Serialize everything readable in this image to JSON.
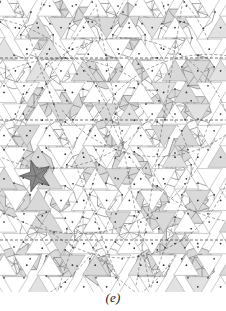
{
  "figure": {
    "caption": "(e)",
    "domain_note": "quasiperiodic pentagonal tiling diagram",
    "width": 226,
    "height": 311,
    "panel_height": 292,
    "background_color": "#ffffff"
  },
  "style": {
    "line_color": "#8d8d8d",
    "line_color_strong": "#6f6f6f",
    "dashed_line_color": "#3a3a3a",
    "vertex_color": "#2b2b2b",
    "fill_light": "#d9d9d9",
    "fill_light2": "#e2e2e2",
    "fill_mid": "#c9c9c9",
    "fill_dark": "#8a8a8a",
    "fill_white": "#fefefe",
    "stroke_width_thin": 0.45,
    "stroke_width_main": 0.6,
    "stroke_width_dash": 0.55,
    "vertex_radius": 0.85
  },
  "geometry": {
    "unit": 23.2,
    "cols": 11,
    "rows": 14,
    "row_step": 21.6,
    "col_step": 22.8,
    "rosette_radius": 17.5,
    "pentagon_radius": 12.2,
    "star_points": 5,
    "description": "decagonal rosettes on a near-periodic lattice, each subdivided into 5 or 10 triangular wedges"
  },
  "dashed_lines": {
    "orientation": "horizontal",
    "y_values": [
      58,
      120,
      240
    ],
    "dash_pattern": "3 2"
  },
  "rosettes": [
    {
      "cx": 14,
      "cy": 12,
      "r": 17.0,
      "type": "decagon",
      "fill": "white",
      "rot": 18
    },
    {
      "cx": 60,
      "cy": 10,
      "r": 17.0,
      "type": "decagon",
      "fill": "white",
      "rot": 0
    },
    {
      "cx": 106,
      "cy": 12,
      "r": 17.0,
      "type": "decagon",
      "fill": "white",
      "rot": 18
    },
    {
      "cx": 152,
      "cy": 10,
      "r": 17.0,
      "type": "decagon",
      "fill": "white",
      "rot": 0
    },
    {
      "cx": 198,
      "cy": 12,
      "r": 17.0,
      "type": "decagon",
      "fill": "white",
      "rot": 18
    },
    {
      "cx": 37,
      "cy": 40,
      "r": 17.0,
      "type": "decagon",
      "fill": "white",
      "rot": 0
    },
    {
      "cx": 83,
      "cy": 38,
      "r": 17.0,
      "type": "decagon",
      "fill": "white",
      "rot": 18
    },
    {
      "cx": 129,
      "cy": 40,
      "r": 17.0,
      "type": "decagon",
      "fill": "white",
      "rot": 0
    },
    {
      "cx": 175,
      "cy": 38,
      "r": 17.0,
      "type": "decagon",
      "fill": "white",
      "rot": 18
    },
    {
      "cx": 14,
      "cy": 72,
      "r": 17.0,
      "type": "decagon",
      "fill": "white",
      "rot": 0
    },
    {
      "cx": 60,
      "cy": 74,
      "r": 17.0,
      "type": "decagon",
      "fill": "white",
      "rot": 18
    },
    {
      "cx": 106,
      "cy": 72,
      "r": 17.0,
      "type": "decagon",
      "fill": "light",
      "rot": 0
    },
    {
      "cx": 152,
      "cy": 74,
      "r": 17.0,
      "type": "decagon",
      "fill": "white",
      "rot": 18
    },
    {
      "cx": 198,
      "cy": 72,
      "r": 17.0,
      "type": "decagon",
      "fill": "light",
      "rot": 0
    },
    {
      "cx": 37,
      "cy": 104,
      "r": 17.0,
      "type": "decagon",
      "fill": "light",
      "rot": 18
    },
    {
      "cx": 83,
      "cy": 106,
      "r": 17.0,
      "type": "decagon",
      "fill": "white",
      "rot": 0
    },
    {
      "cx": 129,
      "cy": 104,
      "r": 17.0,
      "type": "decagon",
      "fill": "white",
      "rot": 18
    },
    {
      "cx": 175,
      "cy": 106,
      "r": 17.0,
      "type": "decagon",
      "fill": "light",
      "rot": 0
    },
    {
      "cx": 14,
      "cy": 136,
      "r": 17.0,
      "type": "decagon",
      "fill": "white",
      "rot": 0
    },
    {
      "cx": 60,
      "cy": 138,
      "r": 17.0,
      "type": "decagon",
      "fill": "white",
      "rot": 18
    },
    {
      "cx": 106,
      "cy": 136,
      "r": 17.0,
      "type": "decagon",
      "fill": "light",
      "rot": 0
    },
    {
      "cx": 152,
      "cy": 138,
      "r": 17.0,
      "type": "decagon",
      "fill": "white",
      "rot": 18
    },
    {
      "cx": 198,
      "cy": 136,
      "r": 17.0,
      "type": "decagon",
      "fill": "white",
      "rot": 0
    },
    {
      "cx": 37,
      "cy": 168,
      "r": 17.0,
      "type": "decagon",
      "fill": "light",
      "rot": 18
    },
    {
      "cx": 83,
      "cy": 170,
      "r": 17.0,
      "type": "decagon",
      "fill": "white",
      "rot": 0
    },
    {
      "cx": 129,
      "cy": 168,
      "r": 17.0,
      "type": "decagon",
      "fill": "light",
      "rot": 18
    },
    {
      "cx": 175,
      "cy": 170,
      "r": 17.0,
      "type": "decagon",
      "fill": "white",
      "rot": 0
    },
    {
      "cx": 14,
      "cy": 200,
      "r": 17.0,
      "type": "decagon",
      "fill": "light",
      "rot": 0
    },
    {
      "cx": 60,
      "cy": 202,
      "r": 17.0,
      "type": "decagon",
      "fill": "white",
      "rot": 18
    },
    {
      "cx": 106,
      "cy": 200,
      "r": 17.0,
      "type": "decagon",
      "fill": "white",
      "rot": 0
    },
    {
      "cx": 152,
      "cy": 202,
      "r": 17.0,
      "type": "decagon",
      "fill": "light",
      "rot": 18
    },
    {
      "cx": 198,
      "cy": 200,
      "r": 17.0,
      "type": "decagon",
      "fill": "white",
      "rot": 0
    },
    {
      "cx": 37,
      "cy": 232,
      "r": 17.0,
      "type": "decagon",
      "fill": "white",
      "rot": 18
    },
    {
      "cx": 83,
      "cy": 234,
      "r": 17.0,
      "type": "decagon",
      "fill": "white",
      "rot": 0
    },
    {
      "cx": 129,
      "cy": 232,
      "r": 17.0,
      "type": "decagon",
      "fill": "white",
      "rot": 18
    },
    {
      "cx": 175,
      "cy": 234,
      "r": 17.0,
      "type": "decagon",
      "fill": "light",
      "rot": 0
    },
    {
      "cx": 14,
      "cy": 264,
      "r": 17.0,
      "type": "decagon",
      "fill": "light",
      "rot": 0
    },
    {
      "cx": 60,
      "cy": 266,
      "r": 17.0,
      "type": "decagon",
      "fill": "light",
      "rot": 18
    },
    {
      "cx": 106,
      "cy": 264,
      "r": 17.0,
      "type": "decagon",
      "fill": "white",
      "rot": 0
    },
    {
      "cx": 152,
      "cy": 266,
      "r": 17.0,
      "type": "decagon",
      "fill": "light",
      "rot": 18
    },
    {
      "cx": 198,
      "cy": 264,
      "r": 17.0,
      "type": "decagon",
      "fill": "light",
      "rot": 0
    }
  ],
  "shaded_pentagons": [
    {
      "cx": 86,
      "cy": 18,
      "r": 13.5,
      "rot": 180,
      "fill": "light"
    },
    {
      "cx": 128,
      "cy": 16,
      "r": 13.5,
      "rot": 0,
      "fill": "light"
    },
    {
      "cx": 176,
      "cy": 20,
      "r": 13.5,
      "rot": 180,
      "fill": "light"
    },
    {
      "cx": 96,
      "cy": 70,
      "r": 14.5,
      "rot": 0,
      "fill": "light"
    },
    {
      "cx": 142,
      "cy": 68,
      "r": 13.0,
      "rot": 180,
      "fill": "light"
    },
    {
      "cx": 196,
      "cy": 74,
      "r": 14.0,
      "rot": 0,
      "fill": "light"
    },
    {
      "cx": 34,
      "cy": 108,
      "r": 14.5,
      "rot": 0,
      "fill": "light"
    },
    {
      "cx": 70,
      "cy": 104,
      "r": 14.5,
      "rot": 180,
      "fill": "light"
    },
    {
      "cx": 160,
      "cy": 106,
      "r": 14.0,
      "rot": 0,
      "fill": "light"
    },
    {
      "cx": 198,
      "cy": 108,
      "r": 14.0,
      "rot": 180,
      "fill": "light"
    },
    {
      "cx": 20,
      "cy": 148,
      "r": 14.0,
      "rot": 180,
      "fill": "light"
    },
    {
      "cx": 112,
      "cy": 146,
      "r": 13.0,
      "rot": 0,
      "fill": "light"
    },
    {
      "cx": 182,
      "cy": 150,
      "r": 14.0,
      "rot": 180,
      "fill": "light"
    },
    {
      "cx": 96,
      "cy": 176,
      "r": 14.5,
      "rot": 0,
      "fill": "light"
    },
    {
      "cx": 140,
      "cy": 172,
      "r": 13.0,
      "rot": 180,
      "fill": "light"
    },
    {
      "cx": 36,
      "cy": 216,
      "r": 15.0,
      "rot": 0,
      "fill": "light"
    },
    {
      "cx": 150,
      "cy": 218,
      "r": 14.0,
      "rot": 180,
      "fill": "light"
    },
    {
      "cx": 196,
      "cy": 212,
      "r": 14.0,
      "rot": 0,
      "fill": "light"
    },
    {
      "cx": 28,
      "cy": 258,
      "r": 14.5,
      "rot": 0,
      "fill": "light"
    },
    {
      "cx": 98,
      "cy": 272,
      "r": 13.5,
      "rot": 180,
      "fill": "light"
    },
    {
      "cx": 160,
      "cy": 258,
      "r": 14.5,
      "rot": 0,
      "fill": "light"
    },
    {
      "cx": 202,
      "cy": 268,
      "r": 13.0,
      "rot": 180,
      "fill": "light"
    }
  ],
  "dark_star": {
    "cx": 36,
    "cy": 176,
    "outer_r": 16.5,
    "inner_r": 6.8,
    "points": 5,
    "rotation": 198,
    "fill": "#8a8a8a",
    "stroke": "#4a4a4a",
    "label": "highlighted-dark-star"
  },
  "seeds": {
    "triangle_mesh": 20240617,
    "shade_mesh": 991
  }
}
